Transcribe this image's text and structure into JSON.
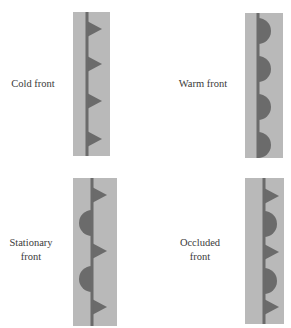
{
  "colors": {
    "background": "#ffffff",
    "strip": "#b9b9b9",
    "symbol": "#6b6b6b",
    "text": "#3a3a3a"
  },
  "panels": [
    {
      "id": "cold",
      "label_lines": [
        "Cold front"
      ],
      "label": {
        "x": 4,
        "y": 77,
        "w": 58
      },
      "strip": {
        "x": 73,
        "y": 12,
        "w": 37,
        "h": 144
      },
      "line_x": 87,
      "symbols": [
        {
          "type": "triangle",
          "side": "right",
          "cy": 29
        },
        {
          "type": "triangle",
          "side": "right",
          "cy": 64
        },
        {
          "type": "triangle",
          "side": "right",
          "cy": 101
        },
        {
          "type": "triangle",
          "side": "right",
          "cy": 139
        }
      ]
    },
    {
      "id": "warm",
      "label_lines": [
        "Warm front"
      ],
      "label": {
        "x": 172,
        "y": 77,
        "w": 62
      },
      "strip": {
        "x": 245,
        "y": 13,
        "w": 38,
        "h": 145
      },
      "line_x": 258,
      "symbols": [
        {
          "type": "semicircle",
          "side": "right",
          "cy": 31
        },
        {
          "type": "semicircle",
          "side": "right",
          "cy": 69
        },
        {
          "type": "semicircle",
          "side": "right",
          "cy": 107
        },
        {
          "type": "semicircle",
          "side": "right",
          "cy": 145
        }
      ]
    },
    {
      "id": "stationary",
      "label_lines": [
        "Stationary",
        "front"
      ],
      "label": {
        "x": 2,
        "y": 236,
        "w": 58
      },
      "strip": {
        "x": 73,
        "y": 178,
        "w": 44,
        "h": 148
      },
      "line_x": 92,
      "symbols": [
        {
          "type": "triangle",
          "side": "right",
          "cy": 195
        },
        {
          "type": "semicircle",
          "side": "left",
          "cy": 223
        },
        {
          "type": "triangle",
          "side": "right",
          "cy": 251
        },
        {
          "type": "semicircle",
          "side": "left",
          "cy": 279
        },
        {
          "type": "triangle",
          "side": "right",
          "cy": 307
        }
      ]
    },
    {
      "id": "occluded",
      "label_lines": [
        "Occluded",
        "front"
      ],
      "label": {
        "x": 170,
        "y": 236,
        "w": 60
      },
      "strip": {
        "x": 245,
        "y": 178,
        "w": 39,
        "h": 146
      },
      "line_x": 264,
      "symbols": [
        {
          "type": "triangle",
          "side": "right",
          "cy": 196
        },
        {
          "type": "semicircle",
          "side": "right",
          "cy": 224
        },
        {
          "type": "triangle",
          "side": "right",
          "cy": 252
        },
        {
          "type": "semicircle",
          "side": "right",
          "cy": 281
        },
        {
          "type": "triangle",
          "side": "right",
          "cy": 307
        }
      ]
    }
  ],
  "geometry": {
    "line_width": 3,
    "triangle_half_height": 8,
    "triangle_length": 15,
    "semicircle_radius": 13
  }
}
